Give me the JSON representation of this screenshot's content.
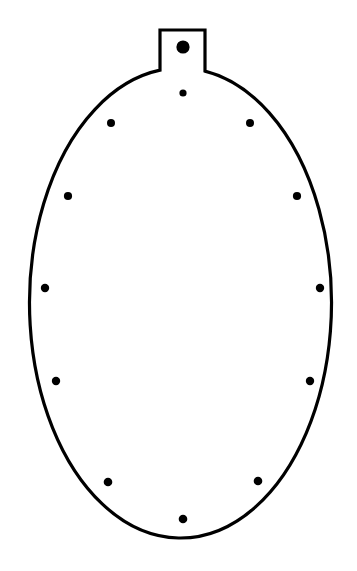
{
  "canvas": {
    "width": 357,
    "height": 571,
    "background_color": "#ffffff",
    "title": "Oval Tag Outline With Perimeter Dots"
  },
  "drawing": {
    "type": "line-drawing",
    "stroke_color": "#000000",
    "fill_color": "#ffffff",
    "stroke_width": 3.2,
    "description": "Closed outline of a vertically oriented oval with a small rectangular tab protruding from the top center, with filled round dots inside.",
    "body": {
      "shape": "ellipse",
      "center_x": 180.5,
      "center_y": 303,
      "radius_x": 151,
      "radius_y": 235,
      "left_edge_x": 29.5,
      "right_edge_x": 331.5,
      "top_edge_y": 68,
      "bottom_edge_y": 538
    },
    "tab": {
      "shape": "rectangle",
      "left_x": 160,
      "right_x": 205,
      "top_y": 30,
      "bottom_y": 68,
      "width": 45,
      "height": 38
    },
    "outline_path": "M 160 68 L 160 30 L 205 30 L 205 68 A 151 235 0 1 1 160 68 Z"
  },
  "dots": {
    "count": 13,
    "color": "#000000",
    "items": [
      {
        "name": "dot-tab-large",
        "cx": 183,
        "cy": 47,
        "r": 6.6,
        "size": "large",
        "location": "inside-top-tab"
      },
      {
        "name": "dot-top-center",
        "cx": 183,
        "cy": 93,
        "r": 3.6,
        "size": "small",
        "location": "top-center"
      },
      {
        "name": "dot-upper-left",
        "cx": 111,
        "cy": 123,
        "r": 4.0,
        "size": "small",
        "location": "upper-left"
      },
      {
        "name": "dot-upper-right",
        "cx": 250,
        "cy": 123,
        "r": 4.0,
        "size": "small",
        "location": "upper-right"
      },
      {
        "name": "dot-mid-upper-left",
        "cx": 68,
        "cy": 196,
        "r": 4.1,
        "size": "small",
        "location": "mid-upper-left"
      },
      {
        "name": "dot-mid-upper-right",
        "cx": 297,
        "cy": 196,
        "r": 4.1,
        "size": "small",
        "location": "mid-upper-right"
      },
      {
        "name": "dot-left-center",
        "cx": 45,
        "cy": 288,
        "r": 4.2,
        "size": "small",
        "location": "left-center"
      },
      {
        "name": "dot-right-center",
        "cx": 320,
        "cy": 288,
        "r": 4.2,
        "size": "small",
        "location": "right-center"
      },
      {
        "name": "dot-mid-lower-left",
        "cx": 56,
        "cy": 381,
        "r": 4.2,
        "size": "small",
        "location": "mid-lower-left"
      },
      {
        "name": "dot-mid-lower-right",
        "cx": 310,
        "cy": 381,
        "r": 4.2,
        "size": "small",
        "location": "mid-lower-right"
      },
      {
        "name": "dot-lower-left",
        "cx": 108,
        "cy": 482,
        "r": 4.3,
        "size": "small",
        "location": "lower-left"
      },
      {
        "name": "dot-lower-right",
        "cx": 258,
        "cy": 481,
        "r": 4.3,
        "size": "small",
        "location": "lower-right"
      },
      {
        "name": "dot-bottom-center",
        "cx": 183,
        "cy": 519,
        "r": 4.3,
        "size": "small",
        "location": "bottom-center"
      }
    ]
  }
}
